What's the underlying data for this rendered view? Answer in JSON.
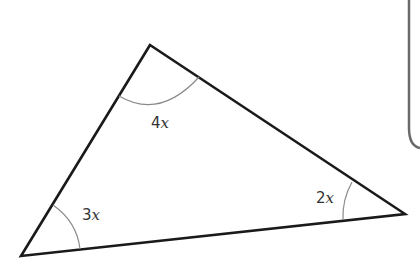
{
  "diagram": {
    "type": "triangle",
    "vertices": {
      "top": [
        150,
        45
      ],
      "bottom_left": [
        21,
        256
      ],
      "right": [
        405,
        214
      ]
    },
    "angles": [
      {
        "vertex": "top",
        "coef": "4",
        "var": "x"
      },
      {
        "vertex": "bottom_left",
        "coef": "3",
        "var": "x"
      },
      {
        "vertex": "right",
        "coef": "2",
        "var": "x"
      }
    ]
  },
  "colors": {
    "stroke": "#1a1a1a",
    "arc": "#8a8a8a",
    "box_border": "#6a6a6a",
    "label": "#333333"
  }
}
